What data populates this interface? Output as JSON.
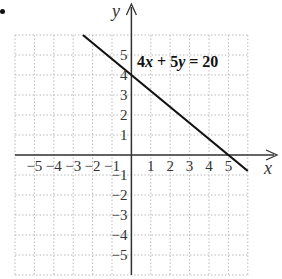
{
  "chart_data": {
    "type": "line",
    "title": "",
    "equation_label": "4x + 5y = 20",
    "equation_parts": {
      "a": "4",
      "x": "x",
      "op": " + ",
      "b": "5",
      "y": "y",
      "eq": " = 20"
    },
    "xlabel": "x",
    "ylabel": "y",
    "xlim": [
      -6,
      6
    ],
    "ylim": [
      -6,
      6
    ],
    "grid": true,
    "grid_style": "dotted",
    "x_ticks": [
      "-5",
      "-4",
      "-3",
      "-2",
      "-1",
      "1",
      "2",
      "3",
      "4",
      "5"
    ],
    "y_ticks": [
      "5",
      "4",
      "3",
      "2",
      "1",
      "-1",
      "-2",
      "-3",
      "-4",
      "-5"
    ],
    "series": [
      {
        "name": "4x + 5y = 20",
        "x": [
          -2.5,
          6
        ],
        "y": [
          6,
          -0.8
        ],
        "intercepts": {
          "x": [
            5,
            0
          ],
          "y": [
            0,
            4
          ]
        }
      }
    ],
    "colors": {
      "line": "#111111",
      "axes": "#333333",
      "grid": "#bbbbbb"
    }
  }
}
